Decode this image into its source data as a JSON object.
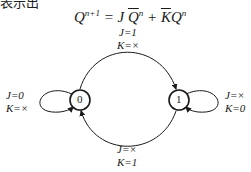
{
  "header": {
    "clipped_text": "表示出"
  },
  "equation": {
    "lhs": "Q",
    "lhs_sup": "n+1",
    "eq": " = J ",
    "term1": "Q",
    "term1_sup": "n",
    "plus": " + ",
    "term2_bar": "K",
    "term2": "Q",
    "term2_sup": "n"
  },
  "states": [
    {
      "id": "0",
      "label": "0"
    },
    {
      "id": "1",
      "label": "1"
    }
  ],
  "transitions": {
    "s0_to_s1": {
      "j": "J=1",
      "k": "K=×"
    },
    "s1_to_s0": {
      "j": "J=×",
      "k": "K=1"
    },
    "s0_self": {
      "j": "J=0",
      "k": "K=×"
    },
    "s1_self": {
      "j": "J=×",
      "k": "K=0"
    }
  }
}
